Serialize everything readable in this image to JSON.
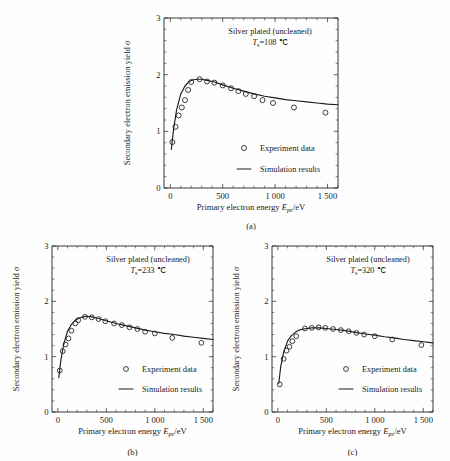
{
  "figure": {
    "background": "#fefefe",
    "ink_color": "#1a1a1a",
    "curve_color": "#1b1b1b"
  },
  "common": {
    "ylabel": "Secondary electron emission yield",
    "ylabel_symbol": "σ",
    "xlabel_prefix": "Primary electron energy",
    "xlabel_symbol": "E",
    "xlabel_subscript": "pe",
    "xlabel_unit": "/eV",
    "material_label": "Silver plated (uncleaned)",
    "temp_symbol": "T",
    "temp_subscript": "s",
    "legend": {
      "experiment": "Experiment data",
      "simulation": "Simulation results",
      "marker": "open-circle",
      "line": "solid"
    },
    "xticks": [
      0,
      500,
      1000,
      1500
    ],
    "xtick_labels": [
      "0",
      "500",
      "1 000",
      "1 500"
    ],
    "yticks": [
      0,
      1,
      2,
      3
    ],
    "ytick_labels": [
      "0",
      "1",
      "2",
      "3"
    ],
    "xlim": [
      -60,
      1600
    ],
    "ylim": [
      0,
      3
    ],
    "grid": false,
    "legend_position": "lower-right-inside"
  },
  "chart_data": [
    {
      "id": "a",
      "caption": "(a)",
      "type": "scatter",
      "title": "Silver plated (uncleaned)",
      "annotation_temperature": "=108 ℃",
      "temperature_value": 108,
      "temperature_unit": "℃",
      "xlabel": "Primary electron energy Epe/eV",
      "ylabel": "Secondary electron emission yield σ",
      "xlim": [
        -60,
        1600
      ],
      "ylim": [
        0,
        3
      ],
      "series": [
        {
          "name": "Experiment data",
          "style": "open-circle",
          "x": [
            20,
            50,
            80,
            110,
            140,
            170,
            200,
            280,
            350,
            420,
            500,
            580,
            650,
            720,
            800,
            880,
            980,
            1180,
            1480
          ],
          "y": [
            0.81,
            1.08,
            1.28,
            1.42,
            1.55,
            1.73,
            1.87,
            1.92,
            1.88,
            1.86,
            1.81,
            1.76,
            1.71,
            1.66,
            1.62,
            1.55,
            1.5,
            1.42,
            1.33
          ]
        },
        {
          "name": "Simulation results",
          "style": "solid-line",
          "x": [
            10,
            30,
            60,
            100,
            140,
            180,
            220,
            260,
            300,
            350,
            420,
            500,
            600,
            700,
            800,
            900,
            1000,
            1100,
            1200,
            1300,
            1400,
            1500,
            1600
          ],
          "y": [
            0.68,
            1.02,
            1.38,
            1.66,
            1.8,
            1.88,
            1.91,
            1.92,
            1.92,
            1.9,
            1.87,
            1.82,
            1.76,
            1.71,
            1.66,
            1.62,
            1.59,
            1.56,
            1.54,
            1.52,
            1.5,
            1.48,
            1.47
          ]
        }
      ]
    },
    {
      "id": "b",
      "caption": "(b)",
      "type": "scatter",
      "title": "Silver plated (uncleaned)",
      "annotation_temperature": "=233 ℃",
      "temperature_value": 233,
      "temperature_unit": "℃",
      "xlabel": "Primary electron energy Epe/eV",
      "ylabel": "Secondary electron emission yield σ",
      "xlim": [
        -60,
        1600
      ],
      "ylim": [
        0,
        3
      ],
      "series": [
        {
          "name": "Experiment data",
          "style": "open-circle",
          "x": [
            20,
            50,
            80,
            110,
            140,
            180,
            210,
            280,
            350,
            420,
            490,
            580,
            660,
            740,
            820,
            900,
            1000,
            1180,
            1480
          ],
          "y": [
            0.75,
            1.1,
            1.22,
            1.33,
            1.47,
            1.6,
            1.66,
            1.72,
            1.71,
            1.68,
            1.64,
            1.6,
            1.57,
            1.53,
            1.5,
            1.45,
            1.42,
            1.34,
            1.25
          ]
        },
        {
          "name": "Simulation results",
          "style": "solid-line",
          "x": [
            10,
            30,
            60,
            100,
            140,
            180,
            220,
            260,
            300,
            350,
            420,
            500,
            600,
            700,
            800,
            900,
            1000,
            1100,
            1200,
            1300,
            1400,
            1500,
            1600
          ],
          "y": [
            0.62,
            0.92,
            1.22,
            1.46,
            1.58,
            1.66,
            1.7,
            1.72,
            1.73,
            1.72,
            1.69,
            1.65,
            1.6,
            1.56,
            1.52,
            1.48,
            1.45,
            1.42,
            1.4,
            1.37,
            1.35,
            1.33,
            1.31
          ]
        }
      ]
    },
    {
      "id": "c",
      "caption": "(c)",
      "type": "scatter",
      "title": "Silver plated (uncleaned)",
      "annotation_temperature": "=320 ℃",
      "temperature_value": 320,
      "temperature_unit": "℃",
      "xlabel": "Primary electron energy Epe/eV",
      "ylabel": "Secondary electron emission yield σ",
      "xlim": [
        -60,
        1600
      ],
      "ylim": [
        0,
        3
      ],
      "series": [
        {
          "name": "Experiment data",
          "style": "open-circle",
          "x": [
            20,
            60,
            90,
            120,
            150,
            190,
            280,
            350,
            420,
            490,
            570,
            650,
            730,
            810,
            890,
            1000,
            1180,
            1480
          ],
          "y": [
            0.5,
            0.96,
            1.11,
            1.18,
            1.28,
            1.37,
            1.51,
            1.52,
            1.53,
            1.52,
            1.5,
            1.48,
            1.46,
            1.43,
            1.4,
            1.37,
            1.31,
            1.21
          ]
        },
        {
          "name": "Simulation results",
          "style": "solid-line",
          "x": [
            10,
            30,
            60,
            100,
            140,
            180,
            220,
            260,
            300,
            350,
            420,
            500,
            600,
            700,
            800,
            900,
            1000,
            1100,
            1200,
            1300,
            1400,
            1500,
            1600
          ],
          "y": [
            0.52,
            0.82,
            1.08,
            1.28,
            1.38,
            1.44,
            1.48,
            1.5,
            1.51,
            1.52,
            1.52,
            1.51,
            1.49,
            1.47,
            1.44,
            1.41,
            1.39,
            1.36,
            1.34,
            1.31,
            1.29,
            1.27,
            1.25
          ]
        }
      ]
    }
  ]
}
